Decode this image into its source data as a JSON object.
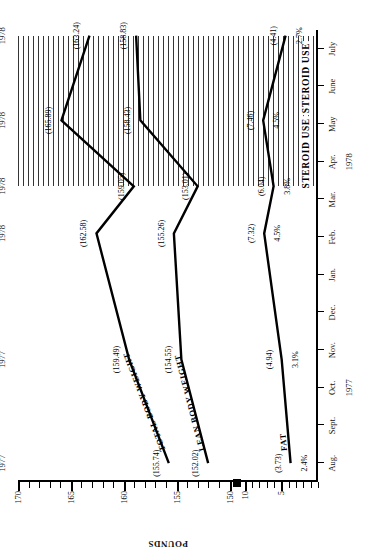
{
  "chart_data": {
    "type": "line",
    "title": "",
    "xlabel": "",
    "ylabel": "POUNDS",
    "ylim": [
      150,
      170
    ],
    "ylim_secondary": [
      0,
      10
    ],
    "y_break": true,
    "y_ticks_upper": [
      "150",
      "155",
      "160",
      "165",
      "170"
    ],
    "y_ticks_lower": [
      "5",
      "10"
    ],
    "grid": false,
    "legend": "inline-labels",
    "x_months": [
      "Aug.",
      "Sept.",
      "Oct.",
      "Nov.",
      "Dec.",
      "Jan.",
      "Feb.",
      "Mar.",
      "Apr.",
      "May",
      "June",
      "July"
    ],
    "x_years": [
      {
        "label": "1977",
        "at_month": "Oct."
      },
      {
        "label": "1978",
        "at_month": "Apr."
      }
    ],
    "measurement_dates": [
      "Aug. 24, 1977",
      "Nov. 15, 1977",
      "Feb. 15, 1978",
      "Mar. 29, 1978",
      "May 16, 1978",
      "July 26, 1978"
    ],
    "series": [
      {
        "name": "TOTAL BODY WEIGHT",
        "unit": "pounds",
        "values": [
          155.74,
          159.49,
          162.58,
          159.05,
          165.89,
          163.24
        ],
        "labels": [
          "(155.74)",
          "(159.49)",
          "(162.58)",
          "(159.05)",
          "(165.89)",
          "(163.24)"
        ]
      },
      {
        "name": "LEAN BODY WEIGHT",
        "unit": "pounds",
        "values": [
          152.02,
          154.55,
          155.26,
          153.01,
          158.43,
          158.83
        ],
        "labels": [
          "(152.02)",
          "(154.55)",
          "(155.26)",
          "(153.01)",
          "(158.43)",
          "(158.83)"
        ]
      },
      {
        "name": "FAT",
        "unit": "pounds",
        "values": [
          3.73,
          4.94,
          7.32,
          6.04,
          7.46,
          4.41
        ],
        "labels": [
          "(3.73)",
          "(4.94)",
          "(7.32)",
          "(6.04)",
          "(7.46)",
          "(4.41)"
        ],
        "percent_labels": [
          "2.4%",
          "3.1%",
          "4.5%",
          "3.8%",
          "4.5%",
          "2.7%"
        ]
      }
    ],
    "annotations": [
      {
        "label": "STEROID USE",
        "from": "Mar. 29, 1978",
        "to": "May 16, 1978",
        "style": "hatched-band"
      },
      {
        "label": "STEROID USE",
        "from": "May 16, 1978",
        "to": "July 26, 1978",
        "style": "hatched-band"
      }
    ]
  }
}
